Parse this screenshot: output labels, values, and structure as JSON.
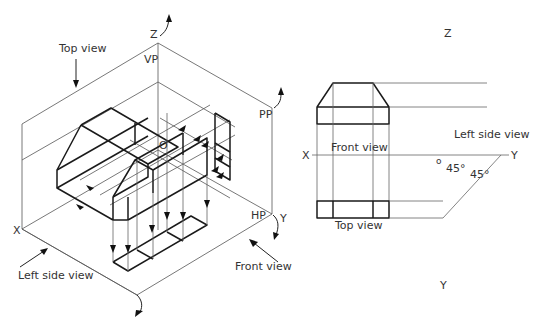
{
  "diagram": {
    "isometric": {
      "labels": {
        "z_axis": "Z",
        "vp": "VP",
        "pp": "PP",
        "hp": "HP",
        "origin": "O",
        "x_axis": "X",
        "y_axis": "Y",
        "top_view": "Top view",
        "left_side_view": "Left side view",
        "front_view": "Front view"
      }
    },
    "orthographic": {
      "labels": {
        "z_axis": "Z",
        "x_axis": "X",
        "y_axis_right": "Y",
        "y_axis_bottom": "Y",
        "origin": "o",
        "front_view": "Front view",
        "top_view": "Top view",
        "left_side_view": "Left side view",
        "angle_1": "45°",
        "angle_2": "45°"
      }
    },
    "colors": {
      "line": "#1a1a1a",
      "construction": "#666666",
      "text": "#333333",
      "background": "#ffffff"
    }
  }
}
